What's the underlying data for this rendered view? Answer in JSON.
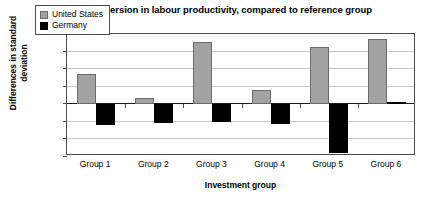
{
  "chart_data": {
    "type": "bar",
    "title": "Relative dispersion in labour productivity, compared to reference group",
    "xlabel": "Investment group",
    "ylabel": "Differences in standard deviation",
    "categories": [
      "Group 1",
      "Group 2",
      "Group 3",
      "Group 4",
      "Group 5",
      "Group 6"
    ],
    "series": [
      {
        "name": "United States",
        "color": "#a3a3a3",
        "values": [
          0.17,
          0.03,
          0.355,
          0.08,
          0.325,
          0.37
        ]
      },
      {
        "name": "Germany",
        "color": "#000000",
        "values": [
          -0.12,
          -0.11,
          -0.105,
          -0.115,
          -0.285,
          0.01
        ]
      }
    ],
    "ylim": [
      -0.3,
      0.4
    ],
    "ytick_labels": [
      "0.4",
      "0.3",
      "0.2",
      "0.1",
      "0",
      "-0.1",
      "-0.2",
      "-0.3"
    ],
    "ytick_values": [
      0.4,
      0.3,
      0.2,
      0.1,
      0,
      -0.1,
      -0.2,
      -0.3
    ],
    "grid": true,
    "legend_position": "top-left-inside"
  }
}
